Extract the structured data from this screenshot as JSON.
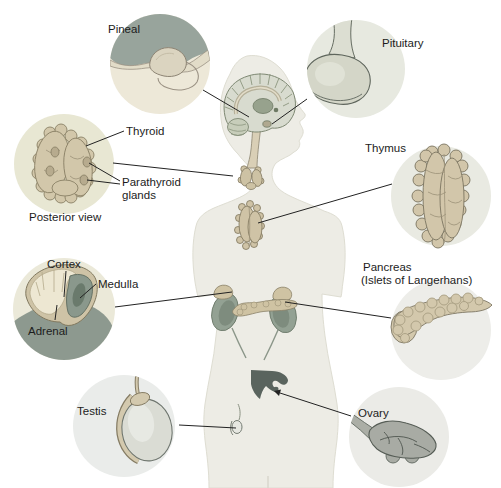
{
  "labels": {
    "pineal": "Pineal",
    "pituitary": "Pituitary",
    "thyroid": "Thyroid",
    "parathyroid_line1": "Parathyroid",
    "parathyroid_line2": "glands",
    "posterior_view": "Posterior view",
    "thymus": "Thymus",
    "cortex": "Cortex",
    "medulla": "Medulla",
    "adrenal": "Adrenal",
    "pancreas_line1": "Pancreas",
    "pancreas_line2": "(Islets of Langerhans)",
    "testis": "Testis",
    "ovary": "Ovary"
  },
  "colors": {
    "background": "#ffffff",
    "body_silhouette": "#edece5",
    "inset_circle_warm": "#e9e8d6",
    "inset_circle_cool": "#eaece8",
    "gland_tan": "#d2c7aa",
    "gland_outline": "#8a8166",
    "organ_sage": "#93a193",
    "kidney_dark": "#8d998f",
    "pineal_backdrop": "#98a49c",
    "reproductive_gray": "#a8aba4",
    "uterus_dark": "#5a645e",
    "leader_line": "#222222",
    "text": "#1c1c1c"
  }
}
